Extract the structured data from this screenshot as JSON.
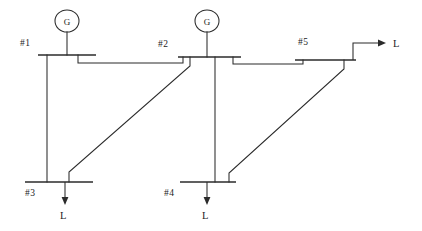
{
  "diagram": {
    "type": "power-system-one-line-diagram",
    "background_color": "#ffffff",
    "line_color": "#2b2b2b",
    "buses": [
      {
        "id": "bus1",
        "label": "#1",
        "label_x": 20,
        "label_y": 46,
        "bar_x1": 38,
        "bar_x2": 96,
        "bar_y": 55
      },
      {
        "id": "bus2",
        "label": "#2",
        "label_x": 158,
        "label_y": 47,
        "bar_x1": 178,
        "bar_x2": 241,
        "bar_y": 57
      },
      {
        "id": "bus3",
        "label": "#3",
        "label_x": 25,
        "label_y": 196,
        "bar_x1": 25,
        "bar_x2": 93,
        "bar_y": 182
      },
      {
        "id": "bus4",
        "label": "#4",
        "label_x": 164,
        "label_y": 196,
        "bar_x1": 180,
        "bar_x2": 236,
        "bar_y": 182
      },
      {
        "id": "bus5",
        "label": "#5",
        "label_x": 298,
        "label_y": 45,
        "bar_x1": 295,
        "bar_x2": 356,
        "bar_y": 60
      }
    ],
    "generators": [
      {
        "id": "gen1",
        "label": "G",
        "cx": 67,
        "cy": 21,
        "rx": 12,
        "ry": 11,
        "stem_x": 67,
        "stem_y1": 32,
        "stem_y2": 55
      },
      {
        "id": "gen2",
        "label": "G",
        "cx": 207,
        "cy": 21,
        "rx": 12,
        "ry": 11,
        "stem_x": 207,
        "stem_y1": 32,
        "stem_y2": 57
      }
    ],
    "loads": [
      {
        "id": "load3",
        "label": "L",
        "label_x": 60,
        "label_y": 219,
        "direction": "down",
        "x": 65,
        "y1": 182,
        "y2": 203
      },
      {
        "id": "load4",
        "label": "L",
        "label_x": 203,
        "label_y": 219,
        "direction": "down",
        "x": 207,
        "y1": 182,
        "y2": 203
      },
      {
        "id": "load5",
        "label": "L",
        "label_x": 394,
        "label_y": 47,
        "direction": "right",
        "x1": 353,
        "y1": 43,
        "x2": 382,
        "y2": 43,
        "riser_y": 60
      }
    ],
    "lines": [
      {
        "id": "line-1-2",
        "from": "bus1",
        "to": "bus2",
        "kind": "horizontal-tie"
      },
      {
        "id": "line-1-3",
        "from": "bus1",
        "to": "bus3",
        "kind": "vertical"
      },
      {
        "id": "line-2-4",
        "from": "bus2",
        "to": "bus4",
        "kind": "vertical"
      },
      {
        "id": "line-3-2",
        "from": "bus3",
        "to": "bus2",
        "kind": "diagonal"
      },
      {
        "id": "line-4-5",
        "from": "bus4",
        "to": "bus5",
        "kind": "diagonal"
      },
      {
        "id": "line-2-5",
        "from": "bus2",
        "to": "bus5",
        "kind": "horizontal-tie"
      }
    ]
  }
}
